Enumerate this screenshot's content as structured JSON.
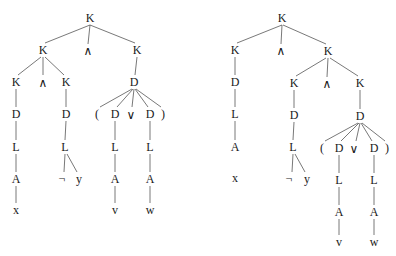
{
  "diagram": {
    "type": "parse-trees",
    "colors": {
      "background": "#ffffff",
      "text": "#1a1a1a",
      "edge": "#555555"
    },
    "trees": [
      {
        "id": "left-tree",
        "nodes": [
          {
            "id": "l0",
            "label": "K",
            "x": 90,
            "y": 18
          },
          {
            "id": "l1",
            "label": "K",
            "x": 43,
            "y": 50
          },
          {
            "id": "l2",
            "label": "∧",
            "x": 88,
            "y": 51
          },
          {
            "id": "l3",
            "label": "K",
            "x": 137,
            "y": 50
          },
          {
            "id": "l4",
            "label": "K",
            "x": 16,
            "y": 82
          },
          {
            "id": "l5",
            "label": "∧",
            "x": 43,
            "y": 83
          },
          {
            "id": "l6",
            "label": "K",
            "x": 66,
            "y": 82
          },
          {
            "id": "l7",
            "label": "D",
            "x": 134,
            "y": 82
          },
          {
            "id": "l8",
            "label": "D",
            "x": 16,
            "y": 114
          },
          {
            "id": "l9",
            "label": "D",
            "x": 66,
            "y": 114
          },
          {
            "id": "l10",
            "label": "(",
            "x": 97,
            "y": 114
          },
          {
            "id": "l11",
            "label": "D",
            "x": 115,
            "y": 114
          },
          {
            "id": "l12",
            "label": "∨",
            "x": 131,
            "y": 115
          },
          {
            "id": "l13",
            "label": "D",
            "x": 150,
            "y": 114
          },
          {
            "id": "l14",
            "label": ")",
            "x": 163,
            "y": 114
          },
          {
            "id": "l15",
            "label": "L",
            "x": 16,
            "y": 147
          },
          {
            "id": "l16",
            "label": "L",
            "x": 65,
            "y": 147
          },
          {
            "id": "l17",
            "label": "L",
            "x": 115,
            "y": 147
          },
          {
            "id": "l18",
            "label": "L",
            "x": 150,
            "y": 147
          },
          {
            "id": "l19",
            "label": "A",
            "x": 16,
            "y": 179
          },
          {
            "id": "l20",
            "label": "¬",
            "x": 62,
            "y": 179
          },
          {
            "id": "l21",
            "label": "y",
            "x": 79,
            "y": 179
          },
          {
            "id": "l22",
            "label": "A",
            "x": 115,
            "y": 179
          },
          {
            "id": "l23",
            "label": "A",
            "x": 150,
            "y": 179
          },
          {
            "id": "l24",
            "label": "x",
            "x": 16,
            "y": 210
          },
          {
            "id": "l25",
            "label": "v",
            "x": 115,
            "y": 210
          },
          {
            "id": "l26",
            "label": "w",
            "x": 150,
            "y": 210
          }
        ],
        "edges": [
          [
            90,
            25,
            45,
            43
          ],
          [
            90,
            25,
            88,
            44
          ],
          [
            90,
            25,
            135,
            43
          ],
          [
            41,
            57,
            18,
            75
          ],
          [
            43,
            57,
            43,
            75
          ],
          [
            45,
            57,
            64,
            75
          ],
          [
            137,
            57,
            135,
            75
          ],
          [
            16,
            89,
            16,
            107
          ],
          [
            66,
            89,
            66,
            107
          ],
          [
            132,
            89,
            100,
            107
          ],
          [
            133,
            89,
            117,
            107
          ],
          [
            134,
            89,
            132,
            107
          ],
          [
            135,
            89,
            148,
            107
          ],
          [
            136,
            89,
            161,
            107
          ],
          [
            16,
            121,
            16,
            140
          ],
          [
            66,
            121,
            65,
            140
          ],
          [
            115,
            121,
            115,
            140
          ],
          [
            150,
            121,
            150,
            140
          ],
          [
            16,
            154,
            16,
            172
          ],
          [
            65,
            154,
            64,
            172
          ],
          [
            67,
            154,
            77,
            172
          ],
          [
            115,
            154,
            115,
            172
          ],
          [
            150,
            154,
            150,
            172
          ],
          [
            16,
            186,
            16,
            203
          ],
          [
            115,
            186,
            115,
            203
          ],
          [
            150,
            186,
            150,
            203
          ]
        ]
      },
      {
        "id": "right-tree",
        "nodes": [
          {
            "id": "r0",
            "label": "K",
            "x": 282,
            "y": 18
          },
          {
            "id": "r1",
            "label": "K",
            "x": 235,
            "y": 50
          },
          {
            "id": "r2",
            "label": "∧",
            "x": 281,
            "y": 51
          },
          {
            "id": "r3",
            "label": "K",
            "x": 328,
            "y": 51
          },
          {
            "id": "r4",
            "label": "D",
            "x": 235,
            "y": 82
          },
          {
            "id": "r5",
            "label": "K",
            "x": 294,
            "y": 83
          },
          {
            "id": "r6",
            "label": "∧",
            "x": 327,
            "y": 84
          },
          {
            "id": "r7",
            "label": "K",
            "x": 360,
            "y": 83
          },
          {
            "id": "r8",
            "label": "L",
            "x": 235,
            "y": 114
          },
          {
            "id": "r9",
            "label": "D",
            "x": 294,
            "y": 115
          },
          {
            "id": "r10",
            "label": "D",
            "x": 360,
            "y": 116
          },
          {
            "id": "r11",
            "label": "A",
            "x": 235,
            "y": 147
          },
          {
            "id": "r12",
            "label": "L",
            "x": 293,
            "y": 147
          },
          {
            "id": "r13",
            "label": "(",
            "x": 322,
            "y": 148
          },
          {
            "id": "r14",
            "label": "D",
            "x": 339,
            "y": 148
          },
          {
            "id": "r15",
            "label": "∨",
            "x": 354,
            "y": 149
          },
          {
            "id": "r16",
            "label": "D",
            "x": 374,
            "y": 148
          },
          {
            "id": "r17",
            "label": ")",
            "x": 387,
            "y": 148
          },
          {
            "id": "r18",
            "label": "x",
            "x": 235,
            "y": 178
          },
          {
            "id": "r19",
            "label": "¬",
            "x": 289,
            "y": 179
          },
          {
            "id": "r20",
            "label": "y",
            "x": 307,
            "y": 179
          },
          {
            "id": "r21",
            "label": "L",
            "x": 339,
            "y": 180
          },
          {
            "id": "r22",
            "label": "L",
            "x": 374,
            "y": 180
          },
          {
            "id": "r23",
            "label": "A",
            "x": 339,
            "y": 212
          },
          {
            "id": "r24",
            "label": "A",
            "x": 374,
            "y": 212
          },
          {
            "id": "r25",
            "label": "v",
            "x": 339,
            "y": 242
          },
          {
            "id": "r26",
            "label": "w",
            "x": 374,
            "y": 242
          }
        ],
        "edges": [
          [
            282,
            25,
            237,
            43
          ],
          [
            282,
            25,
            281,
            44
          ],
          [
            283,
            25,
            326,
            44
          ],
          [
            235,
            57,
            235,
            75
          ],
          [
            326,
            58,
            296,
            76
          ],
          [
            328,
            58,
            327,
            77
          ],
          [
            330,
            58,
            358,
            76
          ],
          [
            235,
            89,
            235,
            107
          ],
          [
            294,
            90,
            294,
            108
          ],
          [
            360,
            90,
            360,
            109
          ],
          [
            235,
            121,
            235,
            140
          ],
          [
            294,
            122,
            293,
            140
          ],
          [
            358,
            123,
            325,
            141
          ],
          [
            359,
            123,
            341,
            141
          ],
          [
            360,
            123,
            356,
            141
          ],
          [
            361,
            123,
            372,
            141
          ],
          [
            362,
            123,
            385,
            141
          ],
          [
            293,
            154,
            292,
            172
          ],
          [
            295,
            154,
            305,
            172
          ],
          [
            339,
            155,
            339,
            173
          ],
          [
            374,
            155,
            374,
            173
          ],
          [
            339,
            187,
            339,
            205
          ],
          [
            374,
            187,
            374,
            205
          ],
          [
            339,
            219,
            339,
            235
          ],
          [
            374,
            219,
            374,
            235
          ]
        ]
      }
    ]
  }
}
